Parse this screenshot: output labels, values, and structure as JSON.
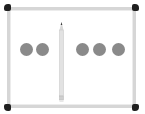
{
  "scene": {
    "description": "whiteboard with a pencil dividing dots",
    "left_group": {
      "count": 2
    },
    "right_group": {
      "count": 3
    },
    "colors": {
      "frame": "#d6d6d6",
      "corner": "#1f1f1f",
      "dot": "#8a8a8a",
      "pencil_body": "#e2e2e2",
      "pencil_tip": "#3a3a3a"
    }
  }
}
